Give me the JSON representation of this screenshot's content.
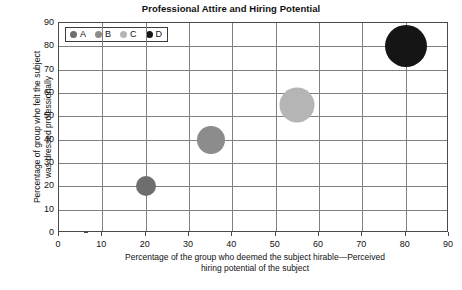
{
  "chart_data": {
    "type": "scatter",
    "title": "Professional Attire and Hiring Potential",
    "xlabel": "Percentage of the group who deemed the subject hirable—Perceived hiring potential of the subject",
    "xlabel_line1": "Percentage of the group who deemed the subject hirable—Perceived",
    "xlabel_line2": "hiring potential of the subject",
    "ylabel": "Percentage of group who felt the subject was dressed professionally",
    "ylabel_line1": "Percentage of group who felt the subject",
    "ylabel_line2": "was dressed professionally",
    "xlim": [
      0,
      90
    ],
    "ylim": [
      0,
      90
    ],
    "xticks": [
      0,
      10,
      20,
      30,
      40,
      50,
      60,
      70,
      80,
      90
    ],
    "yticks": [
      0,
      10,
      20,
      30,
      40,
      50,
      60,
      70,
      80,
      90
    ],
    "grid": true,
    "legend_position": "top-left-inside",
    "series": [
      {
        "name": "A",
        "x": 20,
        "y": 20,
        "size": 20,
        "color": "#6e6e6e"
      },
      {
        "name": "B",
        "x": 35,
        "y": 40,
        "size": 28,
        "color": "#8c8c8c"
      },
      {
        "name": "C",
        "x": 55,
        "y": 55,
        "size": 35,
        "color": "#b5b5b5"
      },
      {
        "name": "D",
        "x": 80,
        "y": 80,
        "size": 42,
        "color": "#151515"
      }
    ]
  },
  "legend": {
    "items": [
      {
        "label": "A",
        "color": "#6e6e6e"
      },
      {
        "label": "B",
        "color": "#8c8c8c"
      },
      {
        "label": "C",
        "color": "#b5b5b5"
      },
      {
        "label": "D",
        "color": "#151515"
      }
    ]
  },
  "colors": {
    "axis": "#4a4a4a",
    "grid": "#808080",
    "background": "#ffffff",
    "text": "#111111"
  }
}
